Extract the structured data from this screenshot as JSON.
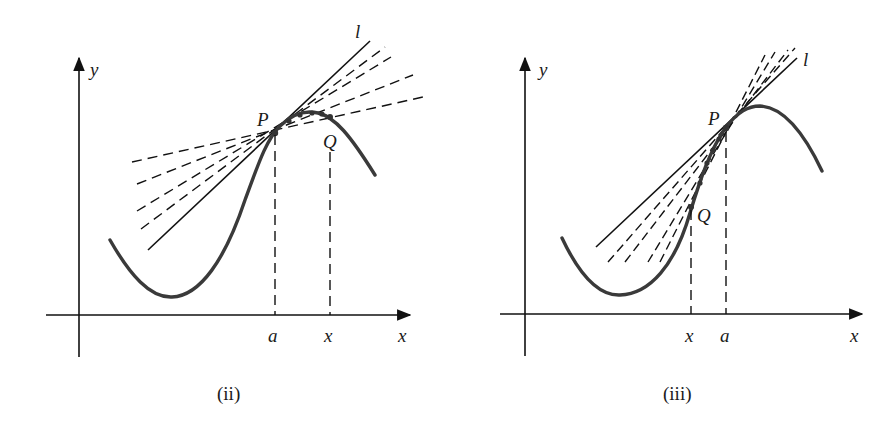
{
  "figures": [
    {
      "id": "ii",
      "caption": "(ii)",
      "labels": {
        "y_axis": "y",
        "x_axis": "x",
        "tangent": "l",
        "point_p": "P",
        "point_q": "Q",
        "tick_a": "a",
        "tick_x": "x"
      },
      "description": "Q approaches P from the right; secant lines PQ (dashed) approach tangent line l"
    },
    {
      "id": "iii",
      "caption": "(iii)",
      "labels": {
        "y_axis": "y",
        "x_axis": "x",
        "tangent": "l",
        "point_p": "P",
        "point_q": "Q",
        "tick_x": "x",
        "tick_a": "a"
      },
      "description": "Q approaches P from the left; secant lines PQ (dashed) approach tangent line l"
    }
  ],
  "colors": {
    "curve": "#3a3a3a",
    "lines": "#111111",
    "background": "#ffffff"
  }
}
